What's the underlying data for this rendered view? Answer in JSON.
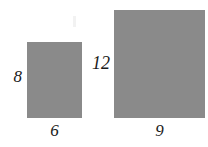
{
  "figure": {
    "background_color": "#ffffff",
    "shape_fill_color": "#8a8a8a",
    "label_color": "#1a1a1a",
    "width_px": 208,
    "height_px": 147
  },
  "shapes": [
    {
      "name": "small-rectangle",
      "kind": "rectangle",
      "height_label": "8",
      "width_label": "6",
      "fill": "#8a8a8a"
    },
    {
      "name": "large-rectangle",
      "kind": "rectangle",
      "height_label": "12",
      "width_label": "9",
      "fill": "#8a8a8a"
    }
  ],
  "labels": {
    "small_height": "8",
    "small_width": "6",
    "large_height": "12",
    "large_width": "9"
  },
  "chart_data": {
    "type": "diagram",
    "units": "",
    "items": [
      {
        "name": "small-rectangle",
        "width": 6,
        "height": 8,
        "width_label": "6",
        "height_label": "8",
        "height_label_position": "left",
        "width_label_position": "below",
        "fill": "#8a8a8a"
      },
      {
        "name": "large-rectangle",
        "width": 9,
        "height": 12,
        "width_label": "9",
        "height_label": "12",
        "height_label_position": "left",
        "width_label_position": "below",
        "fill": "#8a8a8a"
      }
    ],
    "legend": [],
    "grid": false
  }
}
